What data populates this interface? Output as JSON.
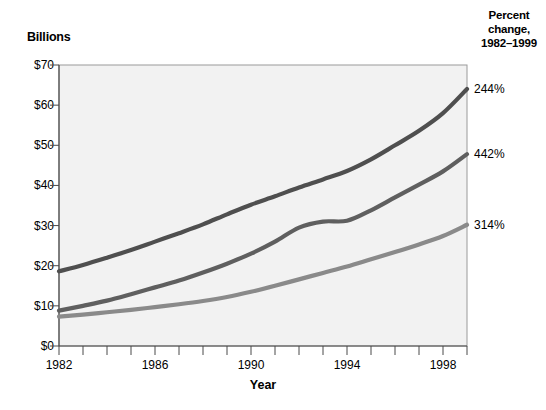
{
  "chart_data": {
    "type": "line",
    "title": "",
    "subtitle": "",
    "ylabel": "Billions",
    "xlabel": "Year",
    "ylim": [
      0,
      70
    ],
    "xlim": [
      1982,
      1999
    ],
    "grid": false,
    "legend_position": "inline-annotations",
    "y_tick_labels": [
      "$70",
      "$60",
      "$50",
      "$40",
      "$30",
      "$20",
      "$10",
      "$0"
    ],
    "y_tick_values": [
      70,
      60,
      50,
      40,
      30,
      20,
      10,
      0
    ],
    "x_tick_labels": [
      "1982",
      "1986",
      "1990",
      "1994",
      "1998"
    ],
    "x_tick_values": [
      1982,
      1986,
      1990,
      1994,
      1998
    ],
    "x_minor_ticks": [
      1982,
      1983,
      1984,
      1985,
      1986,
      1987,
      1988,
      1989,
      1990,
      1991,
      1992,
      1993,
      1994,
      1995,
      1996,
      1997,
      1998,
      1999
    ],
    "x": [
      1982,
      1983,
      1984,
      1985,
      1986,
      1987,
      1988,
      1989,
      1990,
      1991,
      1992,
      1993,
      1994,
      1995,
      1996,
      1997,
      1998,
      1999
    ],
    "series": [
      {
        "name": "Police",
        "label": "Police",
        "color": "#4f4f4f",
        "percent_change_label": "244%",
        "percent_change": 244,
        "values": [
          18.6,
          20.2,
          22.0,
          23.9,
          26.0,
          28.1,
          30.3,
          32.8,
          35.2,
          37.3,
          39.5,
          41.5,
          43.6,
          46.5,
          50.0,
          53.6,
          58.0,
          64.0
        ]
      },
      {
        "name": "Corrections",
        "label": "Corrections",
        "color": "#5f5f5f",
        "percent_change_label": "442%",
        "percent_change": 442,
        "values": [
          8.8,
          10.0,
          11.3,
          12.9,
          14.6,
          16.3,
          18.3,
          20.5,
          23.0,
          26.0,
          29.5,
          31.0,
          31.2,
          33.8,
          37.0,
          40.2,
          43.5,
          47.8
        ]
      },
      {
        "name": "Judicial",
        "label": "Judicial",
        "color": "#8a8a8a",
        "percent_change_label": "314%",
        "percent_change": 314,
        "values": [
          7.3,
          7.8,
          8.4,
          9.0,
          9.7,
          10.4,
          11.2,
          12.2,
          13.5,
          15.0,
          16.6,
          18.2,
          19.8,
          21.6,
          23.4,
          25.3,
          27.4,
          30.2
        ]
      }
    ]
  },
  "right_panel": {
    "header_line1": "Percent",
    "header_line2": "change,",
    "header_line3": "1982–1999"
  },
  "plot_geometry": {
    "left": 59,
    "right": 467,
    "top": 65,
    "bottom": 346
  }
}
